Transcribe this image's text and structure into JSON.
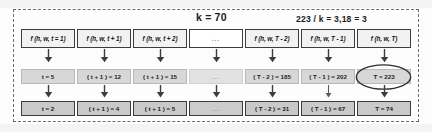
{
  "header": {
    "k_label": "k = 70",
    "division_label": "223 / k = 3,18 = 3"
  },
  "rows": {
    "feature_row": {
      "name": "feature-map-row",
      "cells": [
        {
          "text": "f (h, w, t = 1)",
          "placeholder": false
        },
        {
          "text": "f (h, w, t + 1)",
          "placeholder": false
        },
        {
          "text": "f (h, w, t + 2)",
          "placeholder": false
        },
        {
          "text": "...",
          "placeholder": true
        },
        {
          "text": "f (h, w,  T - 2)",
          "placeholder": false
        },
        {
          "text": "f (h, w, T - 1)",
          "placeholder": false
        },
        {
          "text": "f (h, w, T)",
          "placeholder": false
        }
      ]
    },
    "index_row": {
      "name": "frame-index-row",
      "cells": [
        {
          "text": "t = 5",
          "placeholder": false,
          "highlighted": false
        },
        {
          "text": "( t + 1 ) = 12",
          "placeholder": false,
          "highlighted": false
        },
        {
          "text": "( t + 1 ) = 15",
          "placeholder": false,
          "highlighted": false
        },
        {
          "text": "...",
          "placeholder": true,
          "highlighted": false
        },
        {
          "text": "( T - 2 ) = 185",
          "placeholder": false,
          "highlighted": false
        },
        {
          "text": "( T - 1 ) = 202",
          "placeholder": false,
          "highlighted": false
        },
        {
          "text": "T = 223",
          "placeholder": false,
          "highlighted": true
        }
      ]
    },
    "reduced_row": {
      "name": "reduced-index-row",
      "cells": [
        {
          "text": "t = 2",
          "placeholder": false
        },
        {
          "text": "( t + 1 ) = 4",
          "placeholder": false
        },
        {
          "text": "( t + 1 ) = 5",
          "placeholder": false
        },
        {
          "text": "...",
          "placeholder": true
        },
        {
          "text": "( T - 2 ) = 31",
          "placeholder": false
        },
        {
          "text": "( T - 1 ) = 67",
          "placeholder": false
        },
        {
          "text": "T = 74",
          "placeholder": false
        }
      ]
    }
  },
  "arrows": {
    "icon": "arrow-down-icon",
    "count": 7
  },
  "annotations": {
    "highlight_shape": "ellipse-highlight",
    "frame_border_style": "dashed"
  },
  "colors": {
    "frame_border": "#6d6d6d",
    "feature_cell_fill": "#f2f2f2",
    "index_cell_fill": "#d7d7d7",
    "reduced_cell_fill": "#c9c9c9",
    "stroke_dark": "#3c3c3c",
    "text": "#141414"
  }
}
